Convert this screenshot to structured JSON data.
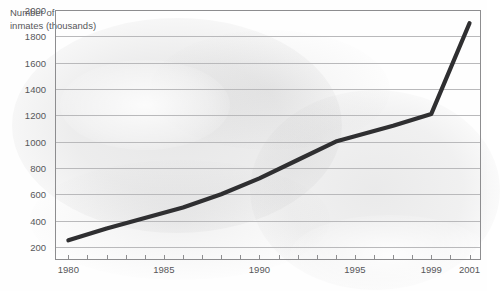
{
  "axis_title": "Number of\ninmates (thousands)",
  "colors": {
    "line": "#2f2f31",
    "text": "#57575a",
    "grid": "#b9b9bb",
    "border": "#8d8d8f",
    "background": "#fefefe"
  },
  "chart_data": {
    "type": "line",
    "title": "Number of inmates (thousands)",
    "xlabel": "",
    "ylabel": "Number of inmates (thousands)",
    "xlim": [
      1979.3,
      2001.6
    ],
    "ylim": [
      100,
      2000
    ],
    "grid": true,
    "legend": null,
    "yticks": [
      200,
      400,
      600,
      800,
      1000,
      1200,
      1400,
      1600,
      1800,
      2000
    ],
    "ytick_labels": [
      "200",
      "400",
      "600",
      "800",
      "1000",
      "1200",
      "1400",
      "1600",
      "1800",
      "2000"
    ],
    "xticks": [
      1980,
      1981,
      1982,
      1983,
      1984,
      1985,
      1986,
      1987,
      1988,
      1989,
      1990,
      1991,
      1992,
      1993,
      1994,
      1995,
      1996,
      1997,
      1998,
      1999,
      2000,
      2001
    ],
    "xtick_labels_shown": [
      "1980",
      "1985",
      "1990",
      "1995",
      "1999",
      "2001"
    ],
    "xtick_label_positions": [
      1980,
      1985,
      1990,
      1995,
      1999,
      2001
    ],
    "series": [
      {
        "name": "Number of inmates",
        "x": [
          1980,
          1982,
          1984,
          1986,
          1988,
          1990,
          1992,
          1994,
          1995,
          1997,
          1999,
          2001
        ],
        "values": [
          250,
          340,
          420,
          500,
          600,
          720,
          860,
          1000,
          1040,
          1120,
          1210,
          1900
        ]
      }
    ]
  }
}
